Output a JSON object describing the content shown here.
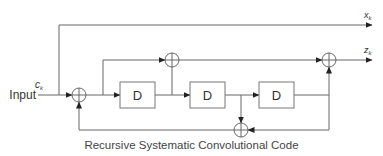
{
  "diagram": {
    "caption": "Recursive Systematic Convolutional Code",
    "input_label": "Input",
    "input_symbol": "c",
    "input_subscript": "k",
    "outputs": [
      {
        "symbol": "x",
        "subscript": "k"
      },
      {
        "symbol": "z",
        "subscript": "k"
      }
    ],
    "delay_blocks": [
      {
        "label": "D"
      },
      {
        "label": "D"
      },
      {
        "label": "D"
      }
    ],
    "adders": 4,
    "colors": {
      "line": "#555555",
      "text": "#333333"
    }
  }
}
